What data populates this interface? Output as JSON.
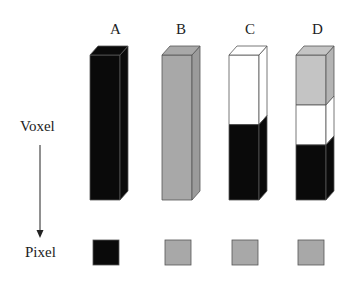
{
  "columns": [
    {
      "label": "A",
      "segments": [
        {
          "color": "#0a0a0a",
          "from": 0,
          "to": 1
        }
      ],
      "pixel_color": "#0a0a0a"
    },
    {
      "label": "B",
      "segments": [
        {
          "color": "#a8a8a8",
          "from": 0,
          "to": 1
        }
      ],
      "pixel_color": "#a8a8a8"
    },
    {
      "label": "C",
      "segments": [
        {
          "color": "#ffffff",
          "from": 0,
          "to": 0.48
        },
        {
          "color": "#0a0a0a",
          "from": 0.48,
          "to": 1
        }
      ],
      "pixel_color": "#a8a8a8"
    },
    {
      "label": "D",
      "segments": [
        {
          "color": "#c4c4c4",
          "from": 0,
          "to": 0.345
        },
        {
          "color": "#ffffff",
          "from": 0.345,
          "to": 0.62
        },
        {
          "color": "#0a0a0a",
          "from": 0.62,
          "to": 1
        }
      ],
      "pixel_color": "#a8a8a8"
    }
  ],
  "labels": {
    "voxel": "Voxel",
    "pixel": "Pixel"
  },
  "colors": {
    "black": "#0a0a0a",
    "gray": "#a8a8a8",
    "light_gray": "#c4c4c4",
    "white": "#ffffff",
    "edge": "#555555"
  }
}
